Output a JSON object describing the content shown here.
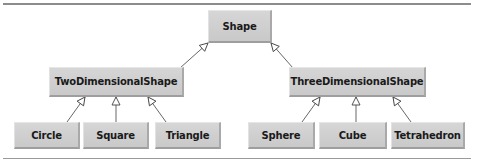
{
  "diagram": {
    "type": "class-hierarchy",
    "root": {
      "label": "Shape"
    },
    "level1": [
      {
        "label": "TwoDimensionalShape"
      },
      {
        "label": "ThreeDimensionalShape"
      }
    ],
    "level2_two": [
      {
        "label": "Circle"
      },
      {
        "label": "Square"
      },
      {
        "label": "Triangle"
      }
    ],
    "level2_three": [
      {
        "label": "Sphere"
      },
      {
        "label": "Cube"
      },
      {
        "label": "Tetrahedron"
      }
    ],
    "edges": [
      {
        "from": "TwoDimensionalShape",
        "to": "Shape",
        "arrow": "hollow-triangle"
      },
      {
        "from": "ThreeDimensionalShape",
        "to": "Shape",
        "arrow": "hollow-triangle"
      },
      {
        "from": "Circle",
        "to": "TwoDimensionalShape",
        "arrow": "hollow-triangle"
      },
      {
        "from": "Square",
        "to": "TwoDimensionalShape",
        "arrow": "hollow-triangle"
      },
      {
        "from": "Triangle",
        "to": "TwoDimensionalShape",
        "arrow": "hollow-triangle"
      },
      {
        "from": "Sphere",
        "to": "ThreeDimensionalShape",
        "arrow": "hollow-triangle"
      },
      {
        "from": "Cube",
        "to": "ThreeDimensionalShape",
        "arrow": "hollow-triangle"
      },
      {
        "from": "Tetrahedron",
        "to": "ThreeDimensionalShape",
        "arrow": "hollow-triangle"
      }
    ],
    "colors": {
      "node_fill": "#cfcfcf",
      "edge": "#555555",
      "rule": "#8c8c8c"
    }
  }
}
